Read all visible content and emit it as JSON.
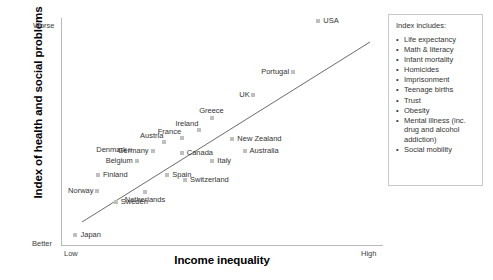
{
  "chart_data": {
    "type": "scatter",
    "title": "",
    "xlabel": "Income inequality",
    "ylabel": "Index of health and social problems",
    "x_tick_labels": [
      "Low",
      "High"
    ],
    "y_tick_labels": [
      "Worse",
      "Better"
    ],
    "y_axis_direction": "Worse at top, Better at bottom",
    "grid": false,
    "legend_position": "right",
    "marker_color": "#bfbfbf",
    "trendline": {
      "show": true,
      "color": "#6b6b6b",
      "description": "Positive linear fit from low inequality / better outcomes to high inequality / worse outcomes"
    },
    "points": [
      {
        "label": "Japan",
        "x": 0.045,
        "y": 0.045,
        "label_pos": "right"
      },
      {
        "label": "Norway",
        "x": 0.112,
        "y": 0.24,
        "label_pos": "left"
      },
      {
        "label": "Sweden",
        "x": 0.17,
        "y": 0.19,
        "label_pos": "right"
      },
      {
        "label": "Finland",
        "x": 0.115,
        "y": 0.31,
        "label_pos": "right"
      },
      {
        "label": "Denmark",
        "x": 0.215,
        "y": 0.42,
        "label_pos": "left"
      },
      {
        "label": "Belgium",
        "x": 0.235,
        "y": 0.37,
        "label_pos": "left"
      },
      {
        "label": "Netherlands",
        "x": 0.26,
        "y": 0.235,
        "label_pos": "below"
      },
      {
        "label": "Germany",
        "x": 0.285,
        "y": 0.415,
        "label_pos": "left"
      },
      {
        "label": "Austria",
        "x": 0.32,
        "y": 0.455,
        "label_pos": "above-left"
      },
      {
        "label": "France",
        "x": 0.375,
        "y": 0.47,
        "label_pos": "above-left"
      },
      {
        "label": "Canada",
        "x": 0.375,
        "y": 0.405,
        "label_pos": "right"
      },
      {
        "label": "Spain",
        "x": 0.33,
        "y": 0.31,
        "label_pos": "right"
      },
      {
        "label": "Switzerland",
        "x": 0.385,
        "y": 0.285,
        "label_pos": "right"
      },
      {
        "label": "Ireland",
        "x": 0.43,
        "y": 0.505,
        "label_pos": "above-left"
      },
      {
        "label": "Greece",
        "x": 0.468,
        "y": 0.56,
        "label_pos": "above"
      },
      {
        "label": "Italy",
        "x": 0.47,
        "y": 0.37,
        "label_pos": "right"
      },
      {
        "label": "New Zealand",
        "x": 0.532,
        "y": 0.465,
        "label_pos": "right"
      },
      {
        "label": "Australia",
        "x": 0.57,
        "y": 0.415,
        "label_pos": "right"
      },
      {
        "label": "UK",
        "x": 0.597,
        "y": 0.66,
        "label_pos": "left"
      },
      {
        "label": "Portugal",
        "x": 0.721,
        "y": 0.76,
        "label_pos": "left"
      },
      {
        "label": "USA",
        "x": 0.799,
        "y": 0.985,
        "label_pos": "right"
      }
    ]
  },
  "legend": {
    "title": "Index includes:",
    "items": [
      "Life expectancy",
      "Math & literacy",
      "Infant mortality",
      "Homicides",
      "Imprisonment",
      "Teenage births",
      "Trust",
      "Obesity",
      "Mental illness (inc. drug and alcohol addiction)",
      "Social mobility"
    ]
  }
}
